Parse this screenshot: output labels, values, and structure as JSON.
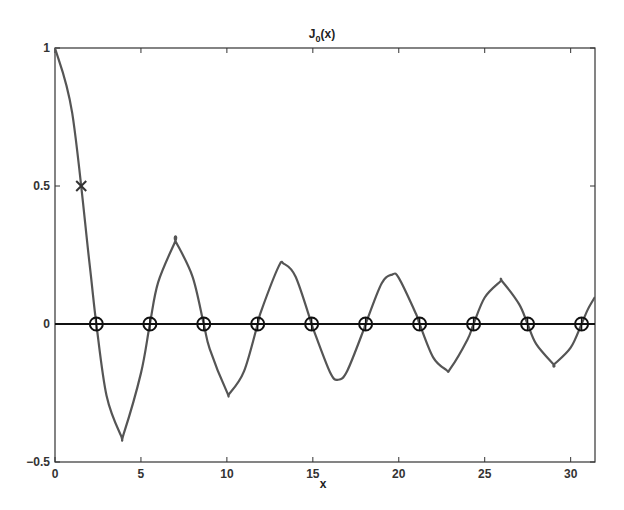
{
  "chart_data": {
    "type": "line",
    "title": "J0(x)",
    "title_main": "J",
    "title_sub": "0",
    "title_rest": "(x)",
    "xlabel": "x",
    "ylabel": "",
    "xlim": [
      0,
      31.416
    ],
    "ylim": [
      -0.5,
      1
    ],
    "xticks": [
      0,
      5,
      10,
      15,
      20,
      25,
      30
    ],
    "xtick_labels": [
      "0",
      "5",
      "10",
      "15",
      "20",
      "25",
      "30"
    ],
    "yticks": [
      -0.5,
      0,
      0.5,
      1
    ],
    "ytick_labels": [
      "−0.5",
      "0",
      "0.5",
      "1"
    ],
    "grid": false,
    "legend": null,
    "series": [
      {
        "name": "J0(x)",
        "style": "line",
        "color": "#555555",
        "x": [
          0,
          1,
          2,
          2.405,
          3,
          3.832,
          4,
          5,
          5.52,
          6,
          7,
          7.016,
          8,
          8.654,
          9,
          10,
          10.173,
          11,
          11.792,
          12,
          13,
          13.324,
          14,
          14.931,
          15,
          16,
          16.471,
          17,
          18,
          18.071,
          19,
          19.616,
          20,
          21,
          21.212,
          22,
          22.76,
          23,
          24,
          24.352,
          25,
          25.904,
          26,
          27,
          27.494,
          28,
          29,
          29.047,
          30,
          30.635,
          31,
          31.416
        ],
        "y": [
          1,
          0.765,
          0.224,
          0,
          -0.26,
          -0.403,
          -0.397,
          -0.178,
          0,
          0.151,
          0.3,
          0.3,
          0.172,
          0,
          -0.09,
          -0.246,
          -0.25,
          -0.171,
          0,
          0.048,
          0.207,
          0.218,
          0.171,
          0,
          -0.014,
          -0.175,
          -0.202,
          -0.17,
          -0.014,
          0,
          0.147,
          0.179,
          0.167,
          0.037,
          0,
          -0.121,
          -0.166,
          -0.162,
          -0.056,
          0,
          0.096,
          0.154,
          0.156,
          0.072,
          0,
          -0.073,
          -0.146,
          -0.146,
          -0.086,
          0,
          0.053,
          0.098
        ]
      },
      {
        "name": "zero line",
        "style": "line",
        "color": "#111111",
        "x": [
          0,
          31.416
        ],
        "y": [
          0,
          0
        ]
      },
      {
        "name": "zeros of J0",
        "style": "marker-circle-plus",
        "color": "#111111",
        "x": [
          2.405,
          5.52,
          8.654,
          11.792,
          14.931,
          18.071,
          21.212,
          24.352,
          27.494,
          30.635
        ],
        "y": [
          0,
          0,
          0,
          0,
          0,
          0,
          0,
          0,
          0,
          0
        ]
      },
      {
        "name": "half-value point",
        "style": "marker-x",
        "color": "#333333",
        "x": [
          1.5254
        ],
        "y": [
          0.5
        ]
      }
    ]
  },
  "colors": {
    "background": "#ffffff",
    "axes": "#333333",
    "curve": "#555555",
    "zero_line": "#111111",
    "markers": "#111111"
  }
}
